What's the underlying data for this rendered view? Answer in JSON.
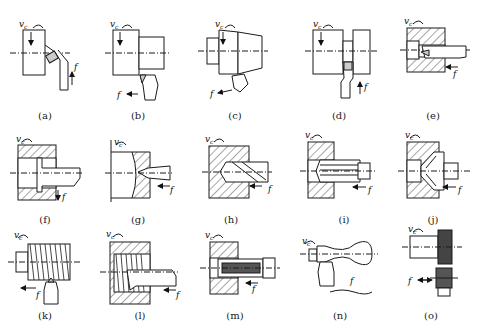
{
  "diagram": {
    "title": "",
    "symbols": {
      "cutting_speed": "v",
      "cutting_speed_sub": "c",
      "feed": "f"
    },
    "colors": {
      "line": "#1a1a1a",
      "background": "#ffffff"
    },
    "panels": [
      {
        "id": "a",
        "label": "(a)"
      },
      {
        "id": "b",
        "label": "(b)"
      },
      {
        "id": "c",
        "label": "(c)"
      },
      {
        "id": "d",
        "label": "(d)"
      },
      {
        "id": "e",
        "label": "(e)"
      },
      {
        "id": "f",
        "label": "(f)"
      },
      {
        "id": "g",
        "label": "(g)"
      },
      {
        "id": "h",
        "label": "(h)"
      },
      {
        "id": "i",
        "label": "(i)"
      },
      {
        "id": "j",
        "label": "(j)"
      },
      {
        "id": "k",
        "label": "(k)"
      },
      {
        "id": "l",
        "label": "(l)"
      },
      {
        "id": "m",
        "label": "(m)"
      },
      {
        "id": "n",
        "label": "(n)"
      },
      {
        "id": "o",
        "label": "(o)"
      }
    ]
  }
}
